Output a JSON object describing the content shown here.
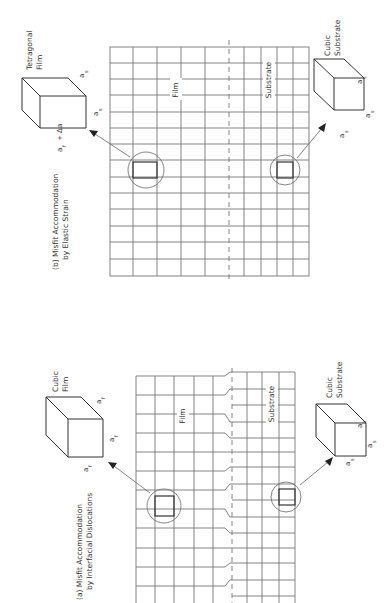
{
  "figure": {
    "panels": [
      {
        "id": "b",
        "caption_line1": "(b)  Misfit Accommodation",
        "caption_line2": "by Elastic Strain",
        "film_region_label": "Film",
        "substrate_region_label": "Substrate",
        "top_cube": {
          "label_line1": "Tetragonal",
          "label_line2": "Film",
          "edge_labels": [
            "a_s",
            "a_s",
            "a_f + Δa"
          ]
        },
        "bottom_cube": {
          "label_line1": "Cubic",
          "label_line2": "Substrate",
          "edge_labels": [
            "a_s",
            "a_s",
            "a_s"
          ]
        }
      },
      {
        "id": "a",
        "caption_line1": "(a)  Misfit Accommodation",
        "caption_line2": "by Interfacial Dislocations",
        "film_region_label": "Film",
        "substrate_region_label": "Substrate",
        "top_cube": {
          "label_line1": "Cubic",
          "label_line2": "Film",
          "edge_labels": [
            "a_f",
            "a_f",
            "a_f"
          ]
        },
        "bottom_cube": {
          "label_line1": "Cubic",
          "label_line2": "Substrate",
          "edge_labels": [
            "a_s",
            "a_s",
            "a_s"
          ]
        }
      }
    ],
    "symbols": {
      "a_s": "a",
      "a_s_sub": "s",
      "a_f": "a",
      "a_f_sub": "f",
      "delta": "+ Δa"
    },
    "colors": {
      "line": "#555555",
      "grid": "#777777",
      "text": "#333333"
    }
  }
}
